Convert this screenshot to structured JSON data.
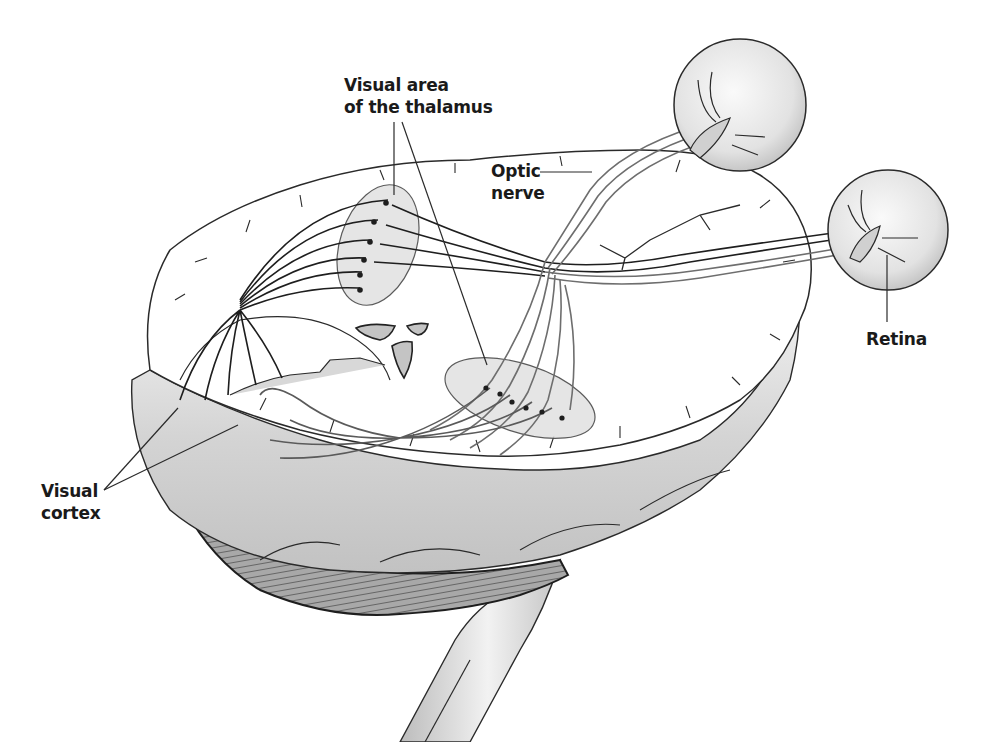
{
  "diagram": {
    "colors": {
      "background": "#ffffff",
      "outline": "#2a2a2a",
      "tissue_light": "#f4f4f4",
      "tissue_mid": "#d6d6d6",
      "tissue_dark": "#9a9a9a",
      "highlight_region": "#e3e3e3",
      "nerve_dark": "#1e1e1e",
      "nerve_gray": "#6e6e6e",
      "label_text": "#1a1a1a"
    },
    "labels": [
      {
        "id": "thalamus",
        "lines": [
          "Visual area",
          "of the thalamus"
        ],
        "x": 344,
        "y": 74,
        "leader_targets": [
          [
            394,
            195
          ],
          [
            487,
            365
          ]
        ]
      },
      {
        "id": "optic-nerve",
        "lines": [
          "Optic",
          "nerve"
        ],
        "x": 491,
        "y": 160,
        "leader_targets": [
          [
            592,
            172
          ]
        ]
      },
      {
        "id": "retina",
        "lines": [
          "Retina"
        ],
        "x": 866,
        "y": 328,
        "leader_targets": [
          [
            887,
            255
          ]
        ]
      },
      {
        "id": "visual-cortex",
        "lines": [
          "Visual",
          "cortex"
        ],
        "x": 41,
        "y": 480,
        "leader_targets": [
          [
            178,
            408
          ],
          [
            238,
            425
          ]
        ]
      }
    ]
  }
}
